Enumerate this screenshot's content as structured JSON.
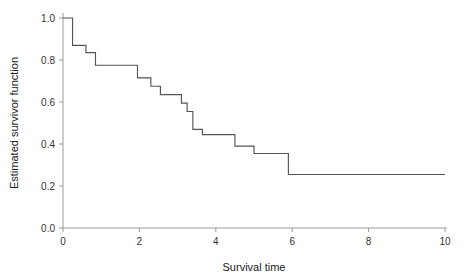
{
  "chart_data": {
    "type": "line",
    "subtype": "step-post",
    "title": "",
    "xlabel": "Survival time",
    "ylabel": "Estimated survivor function",
    "xlim": [
      0,
      10
    ],
    "ylim": [
      0.0,
      1.0
    ],
    "xticks": [
      0,
      2,
      4,
      6,
      8,
      10
    ],
    "xtick_labels": [
      "0",
      "2",
      "4",
      "6",
      "8",
      "10"
    ],
    "yticks": [
      0.0,
      0.2,
      0.4,
      0.6,
      0.8,
      1.0
    ],
    "ytick_labels": [
      "0.0",
      "0.2",
      "0.4",
      "0.6",
      "0.8",
      "1.0"
    ],
    "grid": false,
    "legend": "none",
    "line_color": "#555555",
    "axis_color": "#9a9a9a",
    "series": [
      {
        "name": "Estimated survivor function",
        "x": [
          0.0,
          0.25,
          0.25,
          0.6,
          0.6,
          0.85,
          0.85,
          1.95,
          1.95,
          2.3,
          2.3,
          2.55,
          2.55,
          3.1,
          3.1,
          3.25,
          3.25,
          3.4,
          3.4,
          3.65,
          3.65,
          4.5,
          4.5,
          5.0,
          5.0,
          5.9,
          5.9,
          10.0
        ],
        "y": [
          1.0,
          1.0,
          0.87,
          0.87,
          0.835,
          0.835,
          0.775,
          0.775,
          0.715,
          0.715,
          0.675,
          0.675,
          0.635,
          0.635,
          0.595,
          0.595,
          0.555,
          0.555,
          0.47,
          0.47,
          0.445,
          0.445,
          0.39,
          0.39,
          0.355,
          0.355,
          0.255,
          0.255
        ]
      }
    ],
    "steps": [
      {
        "t": 0.0,
        "survival": 1.0
      },
      {
        "t": 0.25,
        "survival": 0.87
      },
      {
        "t": 0.6,
        "survival": 0.835
      },
      {
        "t": 0.85,
        "survival": 0.775
      },
      {
        "t": 1.95,
        "survival": 0.715
      },
      {
        "t": 2.3,
        "survival": 0.675
      },
      {
        "t": 2.55,
        "survival": 0.635
      },
      {
        "t": 3.1,
        "survival": 0.595
      },
      {
        "t": 3.25,
        "survival": 0.555
      },
      {
        "t": 3.4,
        "survival": 0.47
      },
      {
        "t": 3.65,
        "survival": 0.445
      },
      {
        "t": 4.5,
        "survival": 0.39
      },
      {
        "t": 5.0,
        "survival": 0.355
      },
      {
        "t": 5.9,
        "survival": 0.255
      },
      {
        "t": 10.0,
        "survival": 0.255
      }
    ]
  }
}
